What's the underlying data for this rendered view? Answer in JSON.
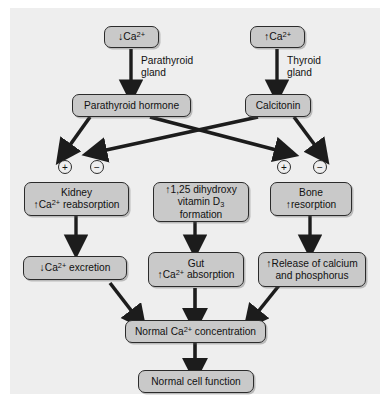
{
  "figure": {
    "background_color": "#eeeeee",
    "box_fill_color": "#c9c9c9",
    "box_border_color": "#2b2b2b",
    "arrow_color": "#1c1c1c"
  },
  "nodes": {
    "low_calcium": {
      "label": "↓Ca2+",
      "text": "Ca",
      "arrow": "↓",
      "charge": "2+"
    },
    "high_calcium": {
      "label": "↑Ca2+",
      "text": "Ca",
      "arrow": "↑",
      "charge": "2+"
    },
    "parathyroid_hormone": {
      "label": "Parathyroid hormone"
    },
    "calcitonin": {
      "label": "Calcitonin"
    },
    "kidney": {
      "line1": "Kidney",
      "line2_arrow": "↑",
      "line2_text": "Ca",
      "line2_charge": "2+",
      "line2_rest": " reabsorption"
    },
    "vitamin_d": {
      "line1_arrow": "↑",
      "line1_text": "1,25 dihydroxy",
      "line2": "vitamin D",
      "line2_sub": "3",
      "line3": "formation"
    },
    "bone": {
      "line1": "Bone",
      "line2_arrow": "↑",
      "line2_text": "resorption"
    },
    "calcium_excretion": {
      "arrow": "↓",
      "text": "Ca",
      "charge": "2+",
      "rest": " excretion"
    },
    "gut": {
      "line1": "Gut",
      "line2_arrow": "↑",
      "line2_text": "Ca",
      "line2_charge": "2+",
      "line2_rest": " absorption"
    },
    "release_calcium": {
      "line1_arrow": "↑",
      "line1_text": "Release of calcium",
      "line2": "and phosphorus"
    },
    "normal_calcium": {
      "prefix": "Normal ",
      "text": "Ca",
      "charge": "2+",
      "rest": " concentration"
    },
    "normal_cell_function": {
      "label": "Normal cell function"
    }
  },
  "gland_labels": {
    "parathyroid": "Parathyroid\ngland",
    "thyroid": "Thyroid\ngland"
  },
  "signs": {
    "kidney_plus": "+",
    "kidney_minus": "−",
    "bone_plus": "+",
    "bone_minus": "−"
  }
}
